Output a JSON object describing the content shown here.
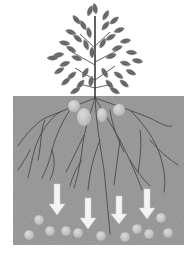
{
  "diagram": {
    "colors": {
      "background": "#ffffff",
      "soil": "#8e8e8e",
      "soil_dark": "#7a7a7a",
      "leaf": "#5e5e5e",
      "leaf_vein": "#9a9a9a",
      "trunk": "#3a3a3a",
      "root": "#4a4a4a",
      "nutrient": "#c8c8c8",
      "arrow": "#f4f4f4"
    },
    "soil_box": {
      "x": 13,
      "y": 96,
      "width": 171,
      "height": 149
    },
    "upper_nutrients": [
      {
        "cx": 74,
        "cy": 106,
        "rx": 6,
        "ry": 6
      },
      {
        "cx": 84,
        "cy": 117,
        "rx": 7,
        "ry": 9
      },
      {
        "cx": 102,
        "cy": 115,
        "rx": 5,
        "ry": 7
      },
      {
        "cx": 119,
        "cy": 110,
        "rx": 6,
        "ry": 6
      }
    ],
    "arrows": [
      {
        "x": 57,
        "y_top": 184,
        "y_tip": 215
      },
      {
        "x": 88,
        "y_top": 198,
        "y_tip": 229
      },
      {
        "x": 119,
        "y_top": 196,
        "y_tip": 224
      },
      {
        "x": 147,
        "y_top": 189,
        "y_tip": 219
      }
    ],
    "lower_nutrients": [
      {
        "cx": 39,
        "cy": 220
      },
      {
        "cx": 29,
        "cy": 235
      },
      {
        "cx": 50,
        "cy": 231
      },
      {
        "cx": 66,
        "cy": 231
      },
      {
        "cx": 78,
        "cy": 233
      },
      {
        "cx": 101,
        "cy": 236
      },
      {
        "cx": 125,
        "cy": 237
      },
      {
        "cx": 137,
        "cy": 229
      },
      {
        "cx": 149,
        "cy": 234
      },
      {
        "cx": 161,
        "cy": 218
      },
      {
        "cx": 168,
        "cy": 233
      }
    ]
  }
}
